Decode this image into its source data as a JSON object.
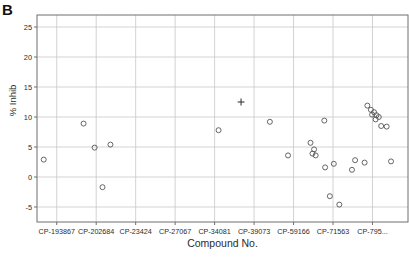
{
  "figure": {
    "panel_letter": "B",
    "background_color": "#ffffff",
    "frame_color": "#6f6f6f",
    "grid_color": "#c8c8c8",
    "marker_color": "#555555"
  },
  "chart_data": {
    "type": "scatter",
    "title": "",
    "xlabel": "Compound No.",
    "ylabel": "% Inhib",
    "ylim": [
      -7.5,
      27
    ],
    "yticks": [
      -5,
      0,
      5,
      10,
      15,
      20,
      25
    ],
    "ytick_labels": [
      "-5",
      "0",
      "5",
      "10",
      "15",
      "20",
      "25"
    ],
    "grid": true,
    "grid_axis": "both",
    "legend": "none",
    "xlim": [
      0,
      9.4
    ],
    "xtick_positions": [
      0.5,
      1.5,
      2.5,
      3.5,
      4.5,
      5.5,
      6.5,
      7.5,
      8.5
    ],
    "xtick_labels": [
      "CP-193867",
      "CP-202684",
      "CP-23424",
      "CP-27067",
      "CP-34081",
      "CP-39073",
      "CP-59166",
      "CP-71563",
      "CP-795..."
    ],
    "series": [
      {
        "name": "open-circle",
        "marker": "circle-open",
        "points": [
          {
            "x": 0.17,
            "y": 2.9
          },
          {
            "x": 1.18,
            "y": 8.9
          },
          {
            "x": 1.46,
            "y": 4.9
          },
          {
            "x": 1.86,
            "y": 5.4
          },
          {
            "x": 1.66,
            "y": -1.7
          },
          {
            "x": 4.6,
            "y": 7.8
          },
          {
            "x": 5.9,
            "y": 9.2
          },
          {
            "x": 6.36,
            "y": 3.6
          },
          {
            "x": 6.93,
            "y": 5.7
          },
          {
            "x": 7.02,
            "y": 4.6
          },
          {
            "x": 6.98,
            "y": 3.9
          },
          {
            "x": 7.06,
            "y": 3.6
          },
          {
            "x": 7.28,
            "y": 9.4
          },
          {
            "x": 7.3,
            "y": 1.6
          },
          {
            "x": 7.42,
            "y": -3.2
          },
          {
            "x": 7.66,
            "y": -4.6
          },
          {
            "x": 7.52,
            "y": 2.2
          },
          {
            "x": 7.98,
            "y": 1.2
          },
          {
            "x": 8.06,
            "y": 2.8
          },
          {
            "x": 8.37,
            "y": 11.9
          },
          {
            "x": 8.46,
            "y": 11.2
          },
          {
            "x": 8.54,
            "y": 10.8
          },
          {
            "x": 8.49,
            "y": 10.4
          },
          {
            "x": 8.6,
            "y": 10.3
          },
          {
            "x": 8.66,
            "y": 10.0
          },
          {
            "x": 8.58,
            "y": 9.6
          },
          {
            "x": 8.72,
            "y": 8.5
          },
          {
            "x": 8.86,
            "y": 8.4
          },
          {
            "x": 8.97,
            "y": 2.6
          },
          {
            "x": 8.3,
            "y": 2.4
          }
        ]
      },
      {
        "name": "plus-marker",
        "marker": "plus",
        "points": [
          {
            "x": 5.17,
            "y": 12.5
          }
        ]
      }
    ]
  }
}
